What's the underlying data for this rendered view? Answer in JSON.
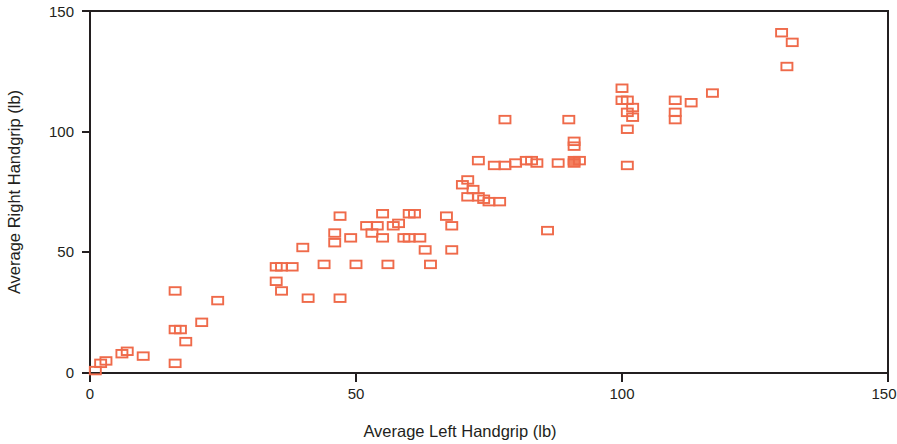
{
  "chart_data": {
    "type": "scatter",
    "title": "",
    "xlabel": "Average Left Handgrip (lb)",
    "ylabel": "Average Right Handgrip (lb)",
    "xlim": [
      0,
      150
    ],
    "ylim": [
      0,
      150
    ],
    "xticks": [
      0,
      50,
      100,
      150
    ],
    "yticks": [
      0,
      50,
      100,
      150
    ],
    "xtick_labels": [
      "0",
      "50",
      "100",
      "150"
    ],
    "ytick_labels": [
      "0",
      "50",
      "100",
      "150"
    ],
    "grid": false,
    "legend": null,
    "marker_style": "open-square",
    "marker_color": "#ef6a4a",
    "axis_color": "#231f20",
    "background_color": "#ffffff",
    "series": [
      {
        "name": "Handgrip pairs",
        "marker": "square",
        "color": "#ef6a4a",
        "points": [
          [
            1,
            1
          ],
          [
            2,
            4
          ],
          [
            3,
            5
          ],
          [
            6,
            8
          ],
          [
            7,
            9
          ],
          [
            10,
            7
          ],
          [
            16,
            34
          ],
          [
            16,
            18
          ],
          [
            16,
            4
          ],
          [
            17,
            18
          ],
          [
            18,
            13
          ],
          [
            21,
            21
          ],
          [
            24,
            30
          ],
          [
            35,
            44
          ],
          [
            35,
            38
          ],
          [
            36,
            44
          ],
          [
            36,
            34
          ],
          [
            38,
            44
          ],
          [
            40,
            52
          ],
          [
            41,
            31
          ],
          [
            44,
            45
          ],
          [
            46,
            58
          ],
          [
            46,
            54
          ],
          [
            47,
            31
          ],
          [
            47,
            65
          ],
          [
            49,
            56
          ],
          [
            50,
            45
          ],
          [
            52,
            61
          ],
          [
            53,
            58
          ],
          [
            54,
            61
          ],
          [
            55,
            66
          ],
          [
            55,
            56
          ],
          [
            56,
            45
          ],
          [
            57,
            61
          ],
          [
            58,
            62
          ],
          [
            59,
            56
          ],
          [
            60,
            66
          ],
          [
            60,
            56
          ],
          [
            61,
            66
          ],
          [
            62,
            56
          ],
          [
            63,
            51
          ],
          [
            64,
            45
          ],
          [
            67,
            65
          ],
          [
            68,
            61
          ],
          [
            68,
            51
          ],
          [
            70,
            78
          ],
          [
            71,
            80
          ],
          [
            71,
            73
          ],
          [
            72,
            76
          ],
          [
            73,
            88
          ],
          [
            73,
            73
          ],
          [
            74,
            72
          ],
          [
            75,
            71
          ],
          [
            76,
            86
          ],
          [
            77,
            71
          ],
          [
            78,
            105
          ],
          [
            78,
            86
          ],
          [
            80,
            87
          ],
          [
            82,
            88
          ],
          [
            83,
            88
          ],
          [
            84,
            87
          ],
          [
            86,
            59
          ],
          [
            88,
            87
          ],
          [
            90,
            105
          ],
          [
            91,
            96
          ],
          [
            91,
            94
          ],
          [
            91,
            88
          ],
          [
            91,
            87
          ],
          [
            92,
            88
          ],
          [
            100,
            118
          ],
          [
            100,
            113
          ],
          [
            101,
            113
          ],
          [
            101,
            108
          ],
          [
            102,
            110
          ],
          [
            102,
            106
          ],
          [
            101,
            101
          ],
          [
            101,
            86
          ],
          [
            110,
            113
          ],
          [
            110,
            108
          ],
          [
            110,
            105
          ],
          [
            113,
            112
          ],
          [
            117,
            116
          ],
          [
            130,
            141
          ],
          [
            132,
            137
          ],
          [
            131,
            127
          ]
        ]
      }
    ]
  },
  "axes": {
    "y_title": "Average Right Handgrip (lb)",
    "x_title": "Average Left Handgrip (lb)",
    "y_tick_0": "0",
    "y_tick_1": "50",
    "y_tick_2": "100",
    "y_tick_3": "150",
    "x_tick_0": "0",
    "x_tick_1": "50",
    "x_tick_2": "100",
    "x_tick_3": "150"
  }
}
